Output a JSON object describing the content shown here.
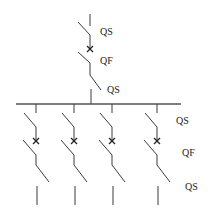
{
  "diagram": {
    "title": "",
    "type": "single-line electrical wiring diagram",
    "incoming": {
      "labels": {
        "top_disconnector": "QS",
        "breaker": "QF",
        "bottom_disconnector": "QS"
      }
    },
    "busbar": {
      "label": ""
    },
    "outgoing_labels": {
      "disconnector": "QS",
      "breaker": "QF",
      "bottom_disconnector": "QS"
    },
    "branches": [
      {
        "id": 1
      },
      {
        "id": 2
      },
      {
        "id": 3
      },
      {
        "id": 4
      }
    ],
    "colors": {
      "line": "#3a3a3a",
      "background": "#ffffff"
    }
  }
}
